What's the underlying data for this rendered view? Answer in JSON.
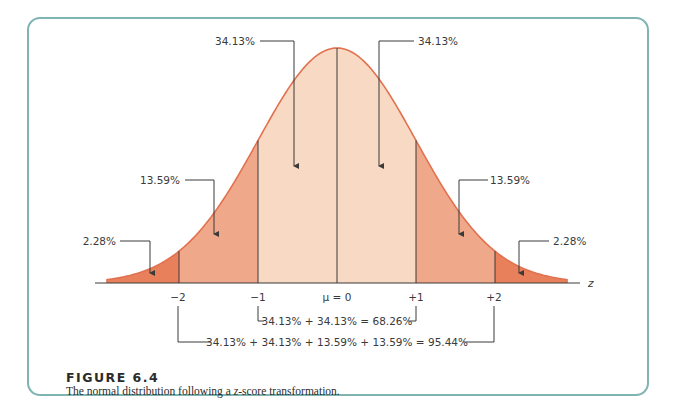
{
  "figure": {
    "title": "FIGURE 6.4",
    "caption_pre": "The normal distribution following a ",
    "caption_italic": "z",
    "caption_post": "-score transformation."
  },
  "colors": {
    "frame": "#7fb4b3",
    "curve": "#e2714f",
    "center_fill": "#f8d9c3",
    "mid_fill": "#efa88a",
    "tail_fill": "#e8805c",
    "line": "#3a3a3a"
  },
  "chart_data": {
    "type": "area",
    "title": "FIGURE 6.4",
    "subtitle": "The normal distribution following a z-score transformation.",
    "xlabel": "z",
    "ylabel": "",
    "x_ticks": [
      "−2",
      "−1",
      "μ = 0",
      "+1",
      "+2"
    ],
    "x_tick_values": [
      -2,
      -1,
      0,
      1,
      2
    ],
    "xlim": [
      -2.95,
      2.9
    ],
    "grid": false,
    "regions": [
      {
        "name": "left tail",
        "from": "-inf",
        "to": -2,
        "percent": 2.28,
        "label": "2.28%"
      },
      {
        "name": "left mid",
        "from": -2,
        "to": -1,
        "percent": 13.59,
        "label": "13.59%"
      },
      {
        "name": "left center",
        "from": -1,
        "to": 0,
        "percent": 34.13,
        "label": "34.13%"
      },
      {
        "name": "right center",
        "from": 0,
        "to": 1,
        "percent": 34.13,
        "label": "34.13%"
      },
      {
        "name": "right mid",
        "from": 1,
        "to": 2,
        "percent": 13.59,
        "label": "13.59%"
      },
      {
        "name": "right tail",
        "from": 2,
        "to": "inf",
        "percent": 2.28,
        "label": "2.28%"
      }
    ],
    "annotations": [
      {
        "range": [
          -1,
          1
        ],
        "text": "34.13% + 34.13% = 68.26%"
      },
      {
        "range": [
          -2,
          2
        ],
        "text": "34.13% + 34.13% + 13.59% + 13.59% = 95.44%"
      }
    ]
  },
  "labels": {
    "center_left": "34.13%",
    "center_right": "34.13%",
    "mid_left": "13.59%",
    "mid_right": "13.59%",
    "tail_left": "2.28%",
    "tail_right": "2.28%",
    "axis_z": "z",
    "tick_m2": "−2",
    "tick_m1": "−1",
    "tick_0": "μ = 0",
    "tick_p1": "+1",
    "tick_p2": "+2",
    "sum_68": "34.13% + 34.13% = 68.26%",
    "sum_95": "34.13% + 34.13% + 13.59% + 13.59% = 95.44%"
  }
}
